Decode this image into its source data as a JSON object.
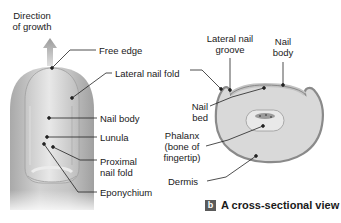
{
  "figure": {
    "panel_a": {
      "labels": {
        "direction_of_growth_line1": "Direction",
        "direction_of_growth_line2": "of growth",
        "free_edge": "Free edge",
        "lateral_nail_fold": "Lateral nail fold",
        "nail_body": "Nail body",
        "lunula": "Lunula",
        "proximal_nail_fold_line1": "Proximal",
        "proximal_nail_fold_line2": "nail fold",
        "eponychium": "Eponychium"
      }
    },
    "panel_b": {
      "labels": {
        "lateral_nail_groove_line1": "Lateral nail",
        "lateral_nail_groove_line2": "groove",
        "nail_body_line1": "Nail",
        "nail_body_line2": "body",
        "nail_bed_line1": "Nail",
        "nail_bed_line2": "bed",
        "phalanx_line1": "Phalanx",
        "phalanx_line2": "(bone of",
        "phalanx_line3": "fingertip)",
        "dermis": "Dermis"
      },
      "caption_badge": "b",
      "caption": "A cross-sectional view"
    },
    "colors": {
      "skin": "#c8c8c8",
      "nail": "#dcdcdc",
      "dermis_fill": "#d9d9d9",
      "outline": "#8a8a8a",
      "leader": "#222222",
      "badge": "#5a5a5a"
    }
  }
}
